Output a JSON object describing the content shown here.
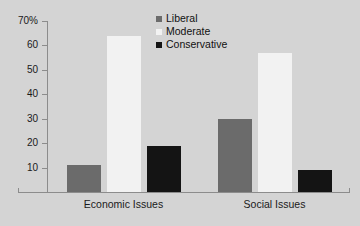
{
  "chart_data": {
    "type": "bar",
    "title": "",
    "xlabel": "",
    "ylabel": "",
    "categories": [
      "Economic Issues",
      "Social Issues"
    ],
    "series": [
      {
        "name": "Liberal",
        "color": "#6b6b6b",
        "values": [
          11,
          30
        ]
      },
      {
        "name": "Moderate",
        "color": "#f2f2f2",
        "values": [
          64,
          57
        ]
      },
      {
        "name": "Conservative",
        "color": "#141414",
        "values": [
          19,
          9
        ]
      }
    ],
    "ylim": [
      0,
      70
    ],
    "ytick_values": [
      70,
      60,
      50,
      40,
      30,
      20,
      10
    ],
    "ytick_labels": [
      "70%",
      "60",
      "50",
      "40",
      "30",
      "20",
      "10"
    ],
    "grid": false,
    "legend_position": "top-right-inside",
    "background_color": "#d4d4d4",
    "axis_color": "#8c8c8c"
  }
}
